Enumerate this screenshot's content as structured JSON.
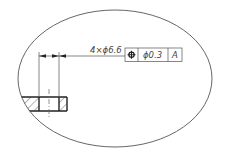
{
  "drawing": {
    "callout": "4×ϕ6.6",
    "fcf": {
      "symbol": "position-icon",
      "tolerance": "ϕ0.3",
      "datum": "A"
    }
  },
  "colors": {
    "line": "#333333",
    "hatch": "#333333",
    "background": "#ffffff"
  }
}
